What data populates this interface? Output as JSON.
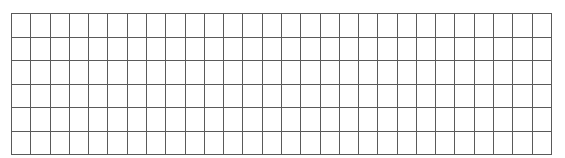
{
  "figure": {
    "kind": "blank-grid",
    "canvas_width_px": 565,
    "canvas_height_px": 158,
    "background_color": "#ffffff"
  },
  "grid": {
    "columns": 28,
    "rows": 6,
    "origin_x_px": 11,
    "origin_y_px": 13,
    "width_px": 541,
    "height_px": 135,
    "cell_width_px": 19.32,
    "cell_height_px": 22.5,
    "line_color": "#5a5a5a",
    "line_width_px": 1,
    "border_color": "#4a4a4a",
    "cell_fill_color": "#ffffff",
    "cell_text": ""
  }
}
